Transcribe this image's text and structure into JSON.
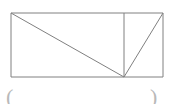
{
  "figure": {
    "type": "geometry-diagram",
    "background_color": "#ffffff",
    "stroke_color": "#808080",
    "stroke_width": 1,
    "canvas": {
      "width": 170,
      "height": 104
    },
    "rectangle": {
      "left": 11,
      "top": 13,
      "right": 163,
      "bottom": 77,
      "width": 152,
      "height": 64
    },
    "points": {
      "top_left": {
        "x": 11,
        "y": 13
      },
      "top_right": {
        "x": 163,
        "y": 13
      },
      "bottom_left": {
        "x": 11,
        "y": 77
      },
      "bottom_right": {
        "x": 163,
        "y": 77
      },
      "top_mid": {
        "x": 124,
        "y": 13
      },
      "bottom_apex": {
        "x": 124,
        "y": 77
      }
    },
    "segments": [
      {
        "name": "rectangle-top-edge",
        "x1": 11,
        "y1": 13,
        "x2": 163,
        "y2": 13
      },
      {
        "name": "rectangle-right-edge",
        "x1": 163,
        "y1": 13,
        "x2": 163,
        "y2": 77
      },
      {
        "name": "rectangle-bottom-edge",
        "x1": 163,
        "y1": 77,
        "x2": 11,
        "y2": 77
      },
      {
        "name": "rectangle-left-edge",
        "x1": 11,
        "y1": 77,
        "x2": 11,
        "y2": 13
      },
      {
        "name": "interior-vertical-segment",
        "x1": 124,
        "y1": 13,
        "x2": 124,
        "y2": 77
      },
      {
        "name": "long-diagonal",
        "x1": 11,
        "y1": 13,
        "x2": 124,
        "y2": 77
      },
      {
        "name": "short-diagonal",
        "x1": 124,
        "y1": 77,
        "x2": 163,
        "y2": 13
      }
    ]
  },
  "caption": {
    "left_mark": "(",
    "right_mark": ")"
  }
}
